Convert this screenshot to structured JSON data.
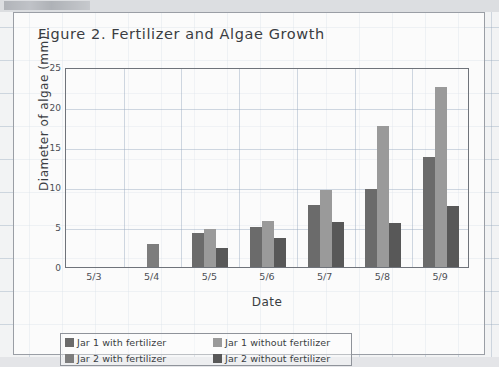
{
  "chart_data": {
    "type": "bar",
    "title": "Figure 2. Fertilizer and Algae Growth",
    "xlabel": "Date",
    "ylabel": "Diameter of algae (mm)",
    "categories": [
      "5/3",
      "5/4",
      "5/5",
      "5/6",
      "5/7",
      "5/8",
      "5/9"
    ],
    "ylim": [
      0,
      25
    ],
    "yticks": [
      0,
      5,
      10,
      15,
      20,
      25
    ],
    "grid": true,
    "legend_position": "below-plot",
    "series": [
      {
        "name": "Jar 1 with fertilizer",
        "color": "#6b6b6b",
        "values": [
          0,
          0,
          4.3,
          5.0,
          7.8,
          9.8,
          13.8
        ]
      },
      {
        "name": "Jar 1 without fertilizer",
        "color": "#9a9a9a",
        "values": [
          0,
          0,
          4.7,
          5.7,
          9.6,
          17.6,
          22.5
        ]
      },
      {
        "name": "Jar 2 with fertilizer",
        "color": "#7d7d7d",
        "values": [
          0,
          2.9,
          0,
          0,
          0,
          0,
          0
        ]
      },
      {
        "name": "Jar 2 without fertilizer",
        "color": "#585858",
        "values": [
          0,
          0,
          2.4,
          3.6,
          5.6,
          5.5,
          7.6
        ]
      }
    ]
  },
  "colors": {
    "axis": "#6f737a",
    "grid": "#96a8be",
    "text": "#3a3d42",
    "card_border": "#9a9ea5"
  }
}
